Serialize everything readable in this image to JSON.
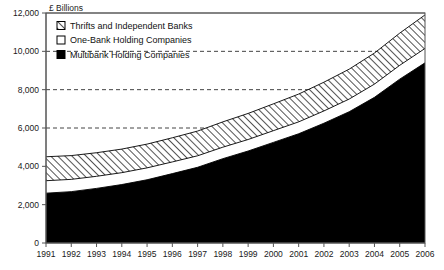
{
  "chart_data": {
    "type": "area",
    "stacked": true,
    "title": "",
    "subtitle": "",
    "xlabel": "",
    "ylabel": "£ Billions",
    "ylim": [
      0,
      12000
    ],
    "ytick_labels": [
      "0",
      "2,000",
      "4,000",
      "6,000",
      "8,000",
      "10,000",
      "12,000"
    ],
    "ytick_values": [
      0,
      2000,
      4000,
      6000,
      8000,
      10000,
      12000
    ],
    "gridlines_dashed_at": [
      6000,
      8000,
      10000
    ],
    "grid": true,
    "legend_position": "top-left-inside",
    "categories": [
      "1991",
      "1992",
      "1993",
      "1994",
      "1995",
      "1996",
      "1997",
      "1998",
      "1999",
      "2000",
      "2001",
      "2002",
      "2003",
      "2004",
      "2005",
      "2006"
    ],
    "series": [
      {
        "name": "Multibank Holding Companies",
        "swatch": "solid-black",
        "color": "#000000",
        "values": [
          2600,
          2680,
          2850,
          3050,
          3300,
          3620,
          3950,
          4400,
          4800,
          5250,
          5700,
          6250,
          6850,
          7600,
          8550,
          9400
        ]
      },
      {
        "name": "One-Bank Holding Companies",
        "swatch": "white-outline",
        "color": "#ffffff",
        "values": [
          650,
          640,
          630,
          620,
          620,
          610,
          600,
          600,
          600,
          610,
          620,
          640,
          660,
          690,
          720,
          750
        ]
      },
      {
        "name": "Thrifts and Independent Banks",
        "swatch": "diagonal-hatch",
        "color": "#ffffff",
        "values": [
          1250,
          1240,
          1230,
          1230,
          1240,
          1260,
          1290,
          1320,
          1360,
          1400,
          1450,
          1500,
          1560,
          1620,
          1680,
          1750
        ]
      }
    ],
    "cumulative_tops": {
      "multibank": [
        2600,
        2680,
        2850,
        3050,
        3300,
        3620,
        3950,
        4400,
        4800,
        5250,
        5700,
        6250,
        6850,
        7600,
        8550,
        9400
      ],
      "one_bank": [
        3250,
        3320,
        3480,
        3670,
        3920,
        4230,
        4550,
        5000,
        5400,
        5860,
        6320,
        6890,
        7510,
        8290,
        9270,
        10150
      ],
      "total": [
        4500,
        4560,
        4710,
        4900,
        5160,
        5490,
        5840,
        6320,
        6760,
        7260,
        7770,
        8390,
        9070,
        9910,
        10950,
        11900
      ]
    }
  },
  "legend": {
    "items": [
      {
        "label": "Thrifts and Independent Banks"
      },
      {
        "label": "One-Bank Holding Companies"
      },
      {
        "label": "Multibank Holding Companies"
      }
    ]
  }
}
